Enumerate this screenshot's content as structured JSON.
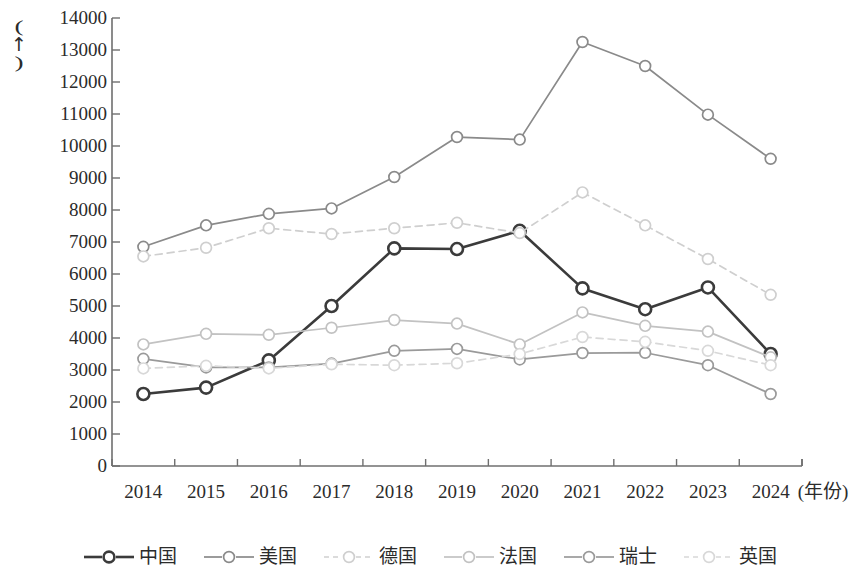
{
  "chart_data": {
    "type": "line",
    "title": "",
    "xlabel": "(年份)",
    "ylabel": "(个)",
    "categories": [
      "2014",
      "2015",
      "2016",
      "2017",
      "2018",
      "2019",
      "2020",
      "2021",
      "2022",
      "2023",
      "2024"
    ],
    "x": [
      2014,
      2015,
      2016,
      2017,
      2018,
      2019,
      2020,
      2021,
      2022,
      2023,
      2024
    ],
    "ylim": [
      0,
      14000
    ],
    "ytick_step": 1000,
    "grid": false,
    "legend_position": "bottom",
    "series": [
      {
        "name": "中国",
        "color": "#3b3b3b",
        "style": "solid",
        "width": 2.6,
        "values": [
          2250,
          2450,
          3300,
          5000,
          6800,
          6780,
          7350,
          5550,
          4900,
          5580,
          3500
        ]
      },
      {
        "name": "美国",
        "color": "#8a8a8a",
        "style": "solid",
        "width": 1.7,
        "values": [
          6850,
          7520,
          7880,
          8050,
          9030,
          10280,
          10200,
          13250,
          12500,
          10980,
          9600
        ]
      },
      {
        "name": "德国",
        "color": "#cfcfcf",
        "style": "dashed",
        "width": 1.7,
        "values": [
          6550,
          6820,
          7430,
          7250,
          7430,
          7600,
          7280,
          8550,
          7520,
          6470,
          5350
        ]
      },
      {
        "name": "法国",
        "color": "#c2c2c2",
        "style": "solid",
        "width": 1.7,
        "values": [
          3800,
          4130,
          4100,
          4320,
          4560,
          4450,
          3800,
          4800,
          4380,
          4200,
          3400
        ]
      },
      {
        "name": "瑞士",
        "color": "#9a9a9a",
        "style": "solid",
        "width": 1.7,
        "values": [
          3350,
          3080,
          3080,
          3200,
          3600,
          3660,
          3330,
          3530,
          3540,
          3150,
          2250
        ]
      },
      {
        "name": "英国",
        "color": "#d8d8d8",
        "style": "dashed",
        "width": 1.7,
        "values": [
          3050,
          3130,
          3050,
          3180,
          3150,
          3210,
          3500,
          4030,
          3880,
          3600,
          3150
        ]
      }
    ],
    "ytick_labels": [
      "14000",
      "13000",
      "12000",
      "11000",
      "10000",
      "9000",
      "8000",
      "7000",
      "6000",
      "5000",
      "4000",
      "3000",
      "2000",
      "1000",
      "0"
    ],
    "ytick_values": [
      14000,
      13000,
      12000,
      11000,
      10000,
      9000,
      8000,
      7000,
      6000,
      5000,
      4000,
      3000,
      2000,
      1000,
      0
    ]
  },
  "axis": {
    "y_unit_open": "(",
    "y_unit_glyph": "↑",
    "y_unit_close": ")",
    "x_unit": "(年份)"
  },
  "legend": {
    "items": [
      {
        "label": "中国"
      },
      {
        "label": "美国"
      },
      {
        "label": "德国"
      },
      {
        "label": "法国"
      },
      {
        "label": "瑞士"
      },
      {
        "label": "英国"
      }
    ]
  }
}
